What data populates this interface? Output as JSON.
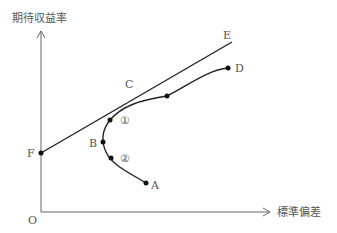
{
  "diagram": {
    "type": "efficient-frontier",
    "y_axis_label": "期待収益率",
    "x_axis_label": "標準偏差",
    "origin_label": "O",
    "points": [
      {
        "id": "A",
        "label": "A"
      },
      {
        "id": "B",
        "label": "B"
      },
      {
        "id": "C",
        "label": "C"
      },
      {
        "id": "D",
        "label": "D"
      },
      {
        "id": "E",
        "label": "E"
      },
      {
        "id": "F",
        "label": "F"
      }
    ],
    "segment_markers": [
      {
        "id": "1",
        "label": "①"
      },
      {
        "id": "2",
        "label": "②"
      }
    ],
    "colors": {
      "line": "#222222",
      "axis": "#666666",
      "text": "#555555"
    }
  }
}
